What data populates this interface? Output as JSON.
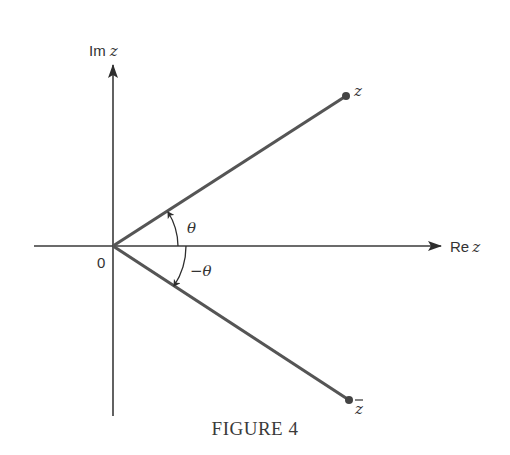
{
  "figure": {
    "caption": "FIGURE 4",
    "axes": {
      "real_label_prefix": "Re",
      "real_label_var": "z",
      "imag_label_prefix": "Im",
      "imag_label_var": "z",
      "origin_label": "0"
    },
    "points": {
      "z_label": "z",
      "zbar_label": "z",
      "zbar_overbar": "‾"
    },
    "angles": {
      "positive_label": "θ",
      "negative_label": "−θ"
    },
    "colors": {
      "axis": "#3a3a3a",
      "vector": "#555555",
      "text": "#333333",
      "background": "#ffffff"
    }
  }
}
